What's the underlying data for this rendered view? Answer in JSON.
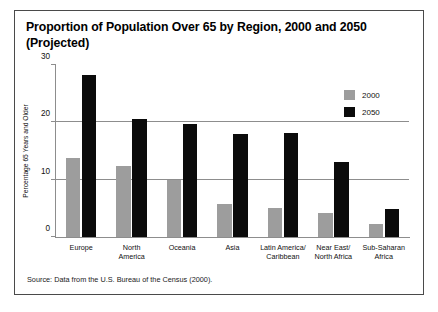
{
  "figure": {
    "title": "Proportion of Population Over 65 by Region, 2000 and 2050 (Projected)",
    "source": "Source: Data from the U.S. Bureau of the Census (2000)."
  },
  "colors": {
    "series_2000": "#9d9d9d",
    "series_2050": "#0b0b0b",
    "axis": "#8d8d8d",
    "border": "#4a4a4a",
    "background": "#ffffff"
  },
  "chart_data": {
    "type": "bar",
    "title": "Proportion of Population Over 65 by Region, 2000 and 2050 (Projected)",
    "xlabel": "",
    "ylabel": "Percentage 65 Years and Older",
    "ylim": [
      0,
      30
    ],
    "yticks": [
      0,
      10,
      20,
      30
    ],
    "ytick_labels": [
      "0",
      "10",
      "20",
      "30"
    ],
    "grid": "horizontal",
    "legend_position": "upper right",
    "categories": [
      "Europe",
      "North America",
      "Oceania",
      "Asia",
      "Latin America/ Caribbean",
      "Near East/ North Africa",
      "Sub-Saharan Africa"
    ],
    "category_lines": [
      [
        "Europe"
      ],
      [
        "North",
        "America"
      ],
      [
        "Oceania"
      ],
      [
        "Asia"
      ],
      [
        "Latin America/",
        "Caribbean"
      ],
      [
        "Near East/",
        "North Africa"
      ],
      [
        "Sub-Saharan",
        "Africa"
      ]
    ],
    "series": [
      {
        "name": "2000",
        "color": "#9d9d9d",
        "values": [
          13.8,
          12.3,
          9.9,
          5.8,
          5.0,
          4.2,
          2.3
        ]
      },
      {
        "name": "2050",
        "color": "#0b0b0b",
        "values": [
          28.3,
          20.5,
          19.7,
          18.0,
          18.1,
          13.0,
          4.9
        ]
      }
    ],
    "annotations": [
      "Source: Data from the U.S. Bureau of the Census (2000)."
    ]
  }
}
